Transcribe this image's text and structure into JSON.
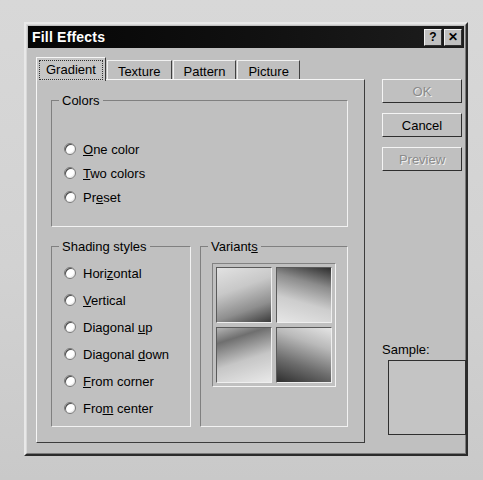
{
  "window": {
    "title": "Fill Effects",
    "titlebar_buttons": [
      {
        "name": "help-button",
        "glyph": "?"
      },
      {
        "name": "close-button",
        "glyph": "✕"
      }
    ]
  },
  "tabs": [
    {
      "label": "Gradient",
      "selected": true
    },
    {
      "label": "Texture",
      "selected": false
    },
    {
      "label": "Pattern",
      "selected": false
    },
    {
      "label": "Picture",
      "selected": false
    }
  ],
  "colors_group": {
    "label": "Colors",
    "options": [
      {
        "pre": "",
        "accel": "O",
        "post": "ne color",
        "selected": false
      },
      {
        "pre": "",
        "accel": "T",
        "post": "wo colors",
        "selected": false
      },
      {
        "pre": "Pr",
        "accel": "e",
        "post": "set",
        "selected": false
      }
    ]
  },
  "shading_group": {
    "label": "Shading styles",
    "options": [
      {
        "pre": "Hori",
        "accel": "z",
        "post": "ontal",
        "selected": false
      },
      {
        "pre": "",
        "accel": "V",
        "post": "ertical",
        "selected": false
      },
      {
        "pre": "Diagonal ",
        "accel": "u",
        "post": "p",
        "selected": false
      },
      {
        "pre": "Diagonal ",
        "accel": "d",
        "post": "own",
        "selected": false
      },
      {
        "pre": "",
        "accel": "F",
        "post": "rom corner",
        "selected": false
      },
      {
        "pre": "Fro",
        "accel": "m",
        "post": " center",
        "selected": false
      }
    ]
  },
  "variants_group": {
    "pre": "Variant",
    "accel": "s",
    "post": "",
    "swatches": [
      {
        "name": "variant-top-left"
      },
      {
        "name": "variant-top-right"
      },
      {
        "name": "variant-bottom-left"
      },
      {
        "name": "variant-bottom-right"
      }
    ]
  },
  "buttons": {
    "ok": {
      "label": "OK",
      "enabled": false
    },
    "cancel": {
      "label": "Cancel",
      "enabled": true
    },
    "preview": {
      "label": "Preview",
      "enabled": false
    }
  },
  "sample": {
    "label": "Sample:"
  },
  "colors": {
    "dialog_face": "#c0c0c0",
    "titlebar": "#101010",
    "titlebar_text": "#ffffff",
    "text": "#000000",
    "disabled_text": "#8b8b8b",
    "page_background": "#d3d3d3"
  }
}
